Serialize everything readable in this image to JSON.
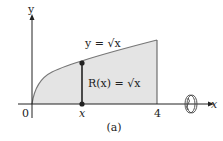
{
  "figure": {
    "caption": "(a)",
    "curve_label": "y = √x",
    "radius_label": "R(x) = √x",
    "axis_labels": {
      "x": "x",
      "y": "y"
    },
    "tick_labels": {
      "origin": "0",
      "x_point": "x",
      "end": "4"
    },
    "colors": {
      "fill": "#e4e4e4",
      "curve": "#777777",
      "axis": "#222222"
    }
  }
}
